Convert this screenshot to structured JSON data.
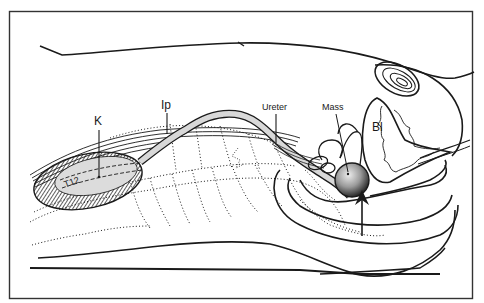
{
  "figure": {
    "labels": {
      "kidney": "K",
      "ip": "Ip",
      "ureter": "Ureter",
      "mass": "Mass",
      "bladder": "Bl",
      "vertebra_t12": "T12",
      "vertebra_l5": "5"
    },
    "colors": {
      "line": "#1a1a1a",
      "ureter_fill": "#d8d8d8",
      "kidney_fill": "#dcdcdc",
      "background": "#ffffff",
      "frame": "#333333"
    },
    "indicators": {
      "arrow": "upward arrow pointing to mass from below"
    }
  }
}
